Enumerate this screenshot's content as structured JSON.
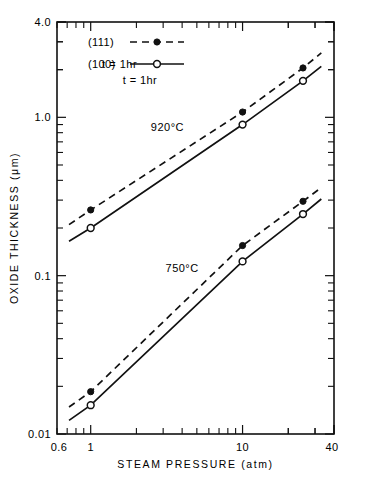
{
  "figure": {
    "background": "#ffffff",
    "ink_color": "#111111"
  },
  "chart_data": {
    "type": "line",
    "title": "",
    "xlabel": "STEAM PRESSURE (atm)",
    "ylabel": "OXIDE THICKNESS (μm)",
    "xscale": "log",
    "yscale": "log",
    "xlim": [
      0.6,
      40
    ],
    "ylim": [
      0.01,
      4.0
    ],
    "grid": false,
    "x_tick_labels": [
      "0.6",
      "1",
      "10",
      "40"
    ],
    "x_tick_values": [
      0.6,
      1,
      10,
      40
    ],
    "y_tick_labels": [
      "0.01",
      "0.1",
      "1.0",
      "4.0"
    ],
    "y_tick_values": [
      0.01,
      0.1,
      1.0,
      4.0
    ],
    "legend_position": "upper-left-inside",
    "annotations": [
      {
        "text": "920°C",
        "x": 3.2,
        "y": 0.82
      },
      {
        "text": "750°C",
        "x": 4.0,
        "y": 0.105
      },
      {
        "text": "t = 1hr",
        "x": 1.55,
        "y": 2.05
      }
    ],
    "series": [
      {
        "name": "(111)",
        "label": "920°C (111)",
        "group": "920°C",
        "linestyle": "dashed",
        "marker": "filled-circle",
        "x": [
          0.72,
          1.0,
          10.0,
          25.0,
          33.0
        ],
        "y": [
          0.21,
          0.26,
          1.08,
          2.05,
          2.55
        ]
      },
      {
        "name": "(100)",
        "label": "920°C (100)",
        "group": "920°C",
        "linestyle": "solid",
        "marker": "open-circle",
        "x": [
          0.72,
          1.0,
          10.0,
          25.0,
          33.0
        ],
        "y": [
          0.165,
          0.2,
          0.9,
          1.7,
          2.1
        ]
      },
      {
        "name": "(111)",
        "label": "750°C (111)",
        "group": "750°C",
        "linestyle": "dashed",
        "marker": "filled-circle",
        "x": [
          0.72,
          1.0,
          10.0,
          25.0,
          33.0
        ],
        "y": [
          0.0148,
          0.0185,
          0.155,
          0.295,
          0.36
        ],
        "marker_x": [
          1.0,
          10.0,
          25.0
        ],
        "marker_y": [
          0.0185,
          0.155,
          0.295
        ]
      },
      {
        "name": "(100)",
        "label": "750°C (100)",
        "group": "750°C",
        "linestyle": "solid",
        "marker": "open-circle",
        "x": [
          0.72,
          1.0,
          10.0,
          25.0,
          33.0
        ],
        "y": [
          0.0122,
          0.0152,
          0.123,
          0.245,
          0.305
        ],
        "marker_x": [
          1.0,
          10.0,
          25.0
        ],
        "marker_y": [
          0.0152,
          0.123,
          0.245
        ]
      }
    ]
  },
  "legend": {
    "items": [
      {
        "label": "(111)",
        "style": "dashed",
        "marker": "filled-circle"
      },
      {
        "label": "(100)",
        "style": "solid",
        "marker": "open-circle"
      }
    ],
    "note": "t = 1hr"
  },
  "axes": {
    "x_title": "STEAM PRESSURE (atm)",
    "y_title": "OXIDE THICKNESS (μm)"
  }
}
